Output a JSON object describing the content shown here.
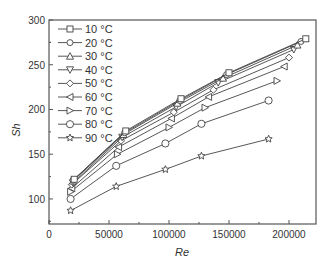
{
  "chart_data": {
    "type": "line",
    "title": "",
    "xlabel": "Re",
    "ylabel": "Sh",
    "xlim": [
      0,
      222500
    ],
    "ylim": [
      72,
      300
    ],
    "xticks": [
      0,
      50000,
      100000,
      150000,
      200000
    ],
    "xtick_labels": [
      "0",
      "50000",
      "100000",
      "150000",
      "200000"
    ],
    "yticks": [
      100,
      150,
      200,
      250,
      300
    ],
    "ytick_labels": [
      "100",
      "150",
      "200",
      "250",
      "300"
    ],
    "grid": false,
    "legend_position": "upper left",
    "series": [
      {
        "name": "10 °C",
        "marker": "square",
        "x": [
          21000,
          64000,
          110000,
          150000,
          214000
        ],
        "y": [
          122,
          176,
          212,
          241,
          279
        ]
      },
      {
        "name": "20 °C",
        "marker": "circle",
        "x": [
          20000,
          63000,
          109000,
          148000,
          210000
        ],
        "y": [
          121,
          174,
          210,
          239,
          276
        ]
      },
      {
        "name": "30 °C",
        "marker": "triangle-up",
        "x": [
          20000,
          62000,
          107000,
          145000,
          207000
        ],
        "y": [
          120,
          172,
          207,
          235,
          272
        ]
      },
      {
        "name": "40 °C",
        "marker": "triangle-down",
        "x": [
          20000,
          61000,
          106000,
          141000,
          204000
        ],
        "y": [
          118,
          169,
          203,
          230,
          267
        ]
      },
      {
        "name": "50 °C",
        "marker": "diamond",
        "x": [
          19000,
          60000,
          104000,
          137000,
          200000
        ],
        "y": [
          116,
          165,
          197,
          222,
          258
        ]
      },
      {
        "name": "60 °C",
        "marker": "triangle-left",
        "x": [
          19000,
          58000,
          102000,
          133000,
          196000
        ],
        "y": [
          112,
          158,
          190,
          214,
          248
        ]
      },
      {
        "name": "70 °C",
        "marker": "triangle-right",
        "x": [
          18000,
          57000,
          100000,
          130000,
          190000
        ],
        "y": [
          108,
          150,
          180,
          202,
          232
        ]
      },
      {
        "name": "80 °C",
        "marker": "hexagon",
        "x": [
          18000,
          56000,
          97000,
          127000,
          183000
        ],
        "y": [
          100,
          137,
          162,
          184,
          210
        ]
      },
      {
        "name": "90 °C",
        "marker": "star",
        "x": [
          18000,
          56000,
          97000,
          127000,
          183000
        ],
        "y": [
          87,
          114,
          133,
          148,
          167
        ]
      }
    ]
  },
  "axes": {
    "x_label": "Re",
    "y_label": "Sh"
  },
  "colors": {
    "line": "#444444",
    "axis": "#555555",
    "marker_fill": "#ffffff"
  }
}
